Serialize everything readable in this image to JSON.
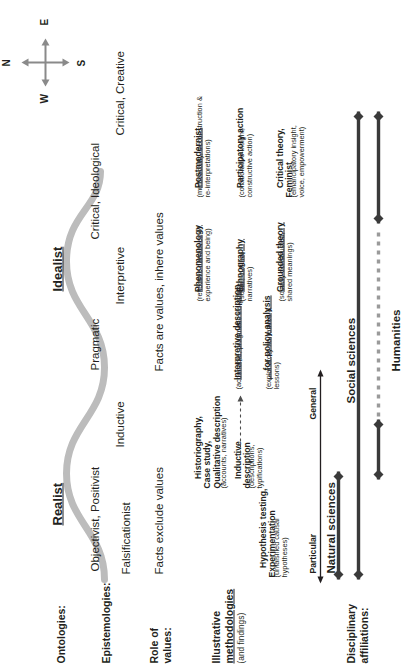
{
  "figure": {
    "type": "conceptual-framework-diagram",
    "orientation": "rotated-90-ccw",
    "accent_wave_color": "#bcbcbc",
    "bar_color": "#3a3a3a",
    "text_color": "#231f20"
  },
  "row_labels": {
    "ontologies": "Ontologies:",
    "epistemologies": "Epistemologies:",
    "role_of_values_line1": "Role of",
    "role_of_values_line2": "values:",
    "methodologies_line1": "Illustrative",
    "methodologies_line2": "methodologies",
    "methodologies_line3": "(and findings)",
    "disciplinary_line1": "Disciplinary",
    "disciplinary_line2": "affiliations:"
  },
  "ontologies": [
    {
      "label": "Realist"
    },
    {
      "label": "Idealist"
    }
  ],
  "epistemologies": [
    {
      "label": "Falsificationist"
    },
    {
      "label": "Objectivist, Positivist"
    },
    {
      "label": "Inductive"
    },
    {
      "label": "Pragmatic"
    },
    {
      "label": "Interpretive"
    },
    {
      "label": "Critical, Ideological"
    },
    {
      "label": "Critical, Creative"
    }
  ],
  "values": [
    {
      "label": "Facts exclude values"
    },
    {
      "label": "Facts are values, inhere values"
    }
  ],
  "methodologies": [
    {
      "title": "Hypothesis testing,\nExperimentation",
      "underline_part": "Experimentation",
      "gloss": "(unfalsified causal\nhypotheses)"
    },
    {
      "title": "Inductive\ndescription",
      "underline_part": "description",
      "gloss": "(descriptions,\ntypifications)"
    },
    {
      "title": "Historiography,\nCase study,\nQualitative description",
      "underline_part": "Qualitative description",
      "gloss": "(accounts, narratives)"
    },
    {
      "title": "... for policy analysis",
      "underline_part": "... for policy analysis",
      "gloss": "(explanatory narratives &\nlessons)"
    },
    {
      "title": "Interpretive description",
      "underline_part": "Interpretive description",
      "gloss": "(actionable, pragmatic insights)"
    },
    {
      "title": "Phenomenology",
      "underline_part": "Phenomenology",
      "gloss": "(reflective narratives of\nexperience and being)"
    },
    {
      "title": "Ethnography",
      "underline_part": "Ethnography",
      "gloss": "(social, cultural\nnarratives)"
    },
    {
      "title": "Grounded theory",
      "underline_part": "Grounded theory",
      "gloss": "(socially constructed,\nshared meanings)"
    },
    {
      "title": "Postmodernist",
      "underline_part": "Postmodernist",
      "gloss": "(multivocality, deconstruction &\nre-interpretations)"
    },
    {
      "title": "Participatory action",
      "underline_part": "Participatory action",
      "gloss": "(collaborative insight,\nconstructive action)"
    },
    {
      "title": "Critical theory,\nFeminist",
      "underline_part": "Feminist",
      "gloss": "(emancipatory insight,\nvoice, empowerment)"
    }
  ],
  "axis": {
    "left_label": "Particular",
    "right_label": "General"
  },
  "disciplines": [
    {
      "label": "Natural sciences",
      "style": "solid"
    },
    {
      "label": "Social sciences",
      "style": "solid"
    },
    {
      "label": "Humanities",
      "style": "dotted-gap"
    }
  ],
  "compass": {
    "north": "N",
    "east": "E",
    "south": "S",
    "west": "W"
  }
}
